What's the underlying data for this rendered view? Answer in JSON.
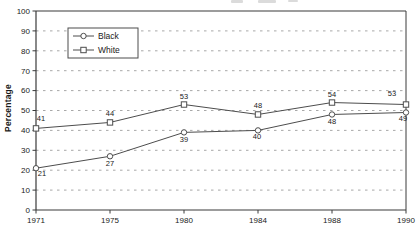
{
  "chart_data": {
    "type": "line",
    "categories": [
      "1971",
      "1975",
      "1980",
      "1984",
      "1988",
      "1990"
    ],
    "series": [
      {
        "name": "Black",
        "marker": "circle",
        "values": [
          21,
          27,
          39,
          40,
          48,
          49
        ]
      },
      {
        "name": "White",
        "marker": "square",
        "values": [
          41,
          44,
          53,
          48,
          54,
          53
        ]
      }
    ],
    "xlabel": "",
    "ylabel": "Percentage",
    "ylim": [
      0,
      100
    ],
    "yticks": [
      0,
      10,
      20,
      30,
      40,
      50,
      60,
      70,
      80,
      90,
      100
    ],
    "grid": "horizontal-dashed",
    "point_labels": true,
    "legend": {
      "position": "upper-left-inset",
      "entries": [
        "Black",
        "White"
      ]
    },
    "colors": {
      "line": "#4d4d4d",
      "marker_fill": "#ffffff",
      "grid": "#9e9e9e",
      "frame": "#3a3a3a",
      "text": "#1a1a1a",
      "background": "#ffffff"
    }
  }
}
